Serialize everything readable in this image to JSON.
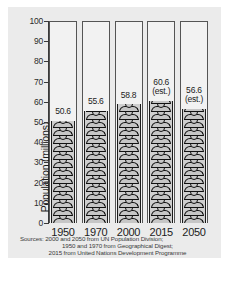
{
  "chart_data": {
    "type": "bar",
    "title": "",
    "xlabel": "",
    "ylabel": "Population (millions)",
    "ylim": [
      0,
      100
    ],
    "yticks": [
      0,
      10,
      20,
      30,
      40,
      50,
      60,
      70,
      80,
      90,
      100
    ],
    "grid": false,
    "legend": "none",
    "categories": [
      "1950",
      "1970",
      "2000",
      "2015",
      "2050"
    ],
    "values": [
      50.6,
      55.6,
      58.8,
      60.6,
      56.6
    ],
    "point_labels": [
      "50.6",
      "55.6",
      "58.8",
      "60.6",
      "56.6"
    ],
    "estimate_flags": [
      false,
      false,
      false,
      true,
      true
    ],
    "estimate_note": "(est.)",
    "style": "pictogram bar chart of stacked person figures inside outlined columns"
  },
  "axis": {
    "y_label": "Population (millions)",
    "y_ticks": [
      "100",
      "90",
      "80",
      "70",
      "60",
      "50",
      "40",
      "30",
      "20",
      "10",
      "0"
    ]
  },
  "bars": [
    {
      "year": "1950",
      "value_label": "50.6",
      "est_label": ""
    },
    {
      "year": "1970",
      "value_label": "55.6",
      "est_label": ""
    },
    {
      "year": "2000",
      "value_label": "58.8",
      "est_label": ""
    },
    {
      "year": "2015",
      "value_label": "60.6",
      "est_label": "(est.)"
    },
    {
      "year": "2050",
      "value_label": "56.6",
      "est_label": "(est.)"
    }
  ],
  "sources": {
    "line1": "Sources: 2000 and 2050 from UN Population Division;",
    "line2": "1950 and 1970 from Geographical Digest;",
    "line3": "2015 from United Nations Development Programme"
  },
  "colors": {
    "panel_bg": "#ebebeb",
    "column_bg": "#f2f2f2",
    "figure_fill": "#c6c6c6",
    "outline": "#111111",
    "text": "#1c1c1c"
  }
}
